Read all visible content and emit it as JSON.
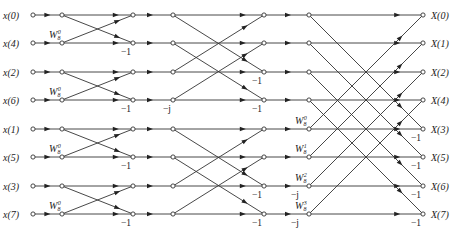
{
  "inputs": [
    "x(0)",
    "x(4)",
    "x(2)",
    "x(6)",
    "x(1)",
    "x(5)",
    "x(3)",
    "x(7)"
  ],
  "outputs": [
    "X(0)",
    "X(1)",
    "X(2)",
    "X(4)",
    "X(3)",
    "X(5)",
    "X(6)",
    "X(7)"
  ],
  "layout": {
    "rows_y": [
      15,
      43,
      72,
      100,
      129,
      157,
      186,
      214
    ],
    "columns_x": [
      33,
      62,
      133,
      173,
      264,
      309,
      423
    ],
    "line_color": "#333333"
  },
  "stages": [
    {
      "name": "stage-1",
      "from_col": 1,
      "to_col": 2,
      "pairs": [
        [
          0,
          1
        ],
        [
          2,
          3
        ],
        [
          4,
          5
        ],
        [
          6,
          7
        ]
      ],
      "twiddles": [
        {
          "row": 1,
          "base": "W",
          "sub": "8",
          "sup": "0"
        },
        {
          "row": 3,
          "base": "W",
          "sub": "8",
          "sup": "0"
        },
        {
          "row": 5,
          "base": "W",
          "sub": "8",
          "sup": "0"
        },
        {
          "row": 7,
          "base": "W",
          "sub": "8",
          "sup": "0"
        }
      ],
      "minus_labels": [
        {
          "row": 1,
          "text": "−1"
        },
        {
          "row": 3,
          "text": "−1"
        },
        {
          "row": 5,
          "text": "−1"
        },
        {
          "row": 7,
          "text": "−1"
        }
      ]
    },
    {
      "name": "stage-2",
      "from_col": 3,
      "to_col": 4,
      "pairs": [
        [
          0,
          2
        ],
        [
          1,
          3
        ],
        [
          4,
          6
        ],
        [
          5,
          7
        ]
      ],
      "pre_factors": [
        {
          "row": 3,
          "text": "−j"
        }
      ],
      "minus_labels": [
        {
          "row": 2,
          "text": "−1"
        },
        {
          "row": 3,
          "text": "−1"
        },
        {
          "row": 6,
          "text": "−1"
        },
        {
          "row": 7,
          "text": "−1"
        }
      ],
      "post_factors": [
        {
          "row": 6,
          "text": "−j"
        },
        {
          "row": 7,
          "text": "−j"
        }
      ]
    },
    {
      "name": "stage-3",
      "from_col": 5,
      "to_col": 6,
      "pairs": [
        [
          0,
          4
        ],
        [
          1,
          5
        ],
        [
          2,
          6
        ],
        [
          3,
          7
        ]
      ],
      "twiddles": [
        {
          "row": 4,
          "base": "W",
          "sub": "8",
          "sup": "0"
        },
        {
          "row": 5,
          "base": "W",
          "sub": "8",
          "sup": "1"
        },
        {
          "row": 6,
          "base": "W",
          "sub": "8",
          "sup": "2"
        },
        {
          "row": 7,
          "base": "W",
          "sub": "8",
          "sup": "3"
        }
      ],
      "minus_labels": [
        {
          "row": 4,
          "text": "−1"
        },
        {
          "row": 5,
          "text": "−1"
        },
        {
          "row": 6,
          "text": "−1"
        },
        {
          "row": 7,
          "text": "−1"
        }
      ]
    }
  ]
}
